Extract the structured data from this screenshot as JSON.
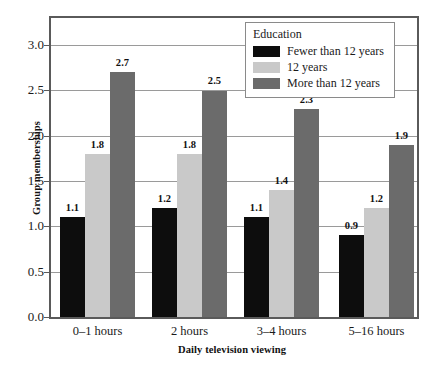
{
  "chart_data": {
    "type": "bar",
    "title": "",
    "subtitle": "",
    "xlabel": "Daily television viewing",
    "ylabel": "Group memberships",
    "categories": [
      "0–1 hours",
      "2 hours",
      "3–4 hours",
      "5–16 hours"
    ],
    "series": [
      {
        "name": "Fewer than 12 years",
        "color": "#0d0d0d",
        "values": [
          1.1,
          1.2,
          1.1,
          0.9
        ],
        "labels": [
          "1.1",
          "1.2",
          "1.1",
          "0.9"
        ]
      },
      {
        "name": "12 years",
        "color": "#c9c9c9",
        "values": [
          1.8,
          1.8,
          1.4,
          1.2
        ],
        "labels": [
          "1.8",
          "1.8",
          "1.4",
          "1.2"
        ]
      },
      {
        "name": "More than 12 years",
        "color": "#6b6b6b",
        "values": [
          2.7,
          2.5,
          2.3,
          1.9
        ],
        "labels": [
          "2.7",
          "2.5",
          "2.3",
          "1.9"
        ]
      }
    ],
    "ylim": [
      0.0,
      3.3
    ],
    "yticks": [
      0.0,
      0.5,
      1.0,
      1.5,
      2.0,
      2.5,
      3.0
    ],
    "ytick_labels": [
      "0.0",
      "0.5",
      "1.0",
      "1.5",
      "2.0",
      "2.5",
      "3.0"
    ],
    "grid": "horizontal",
    "legend": {
      "title": "Education",
      "position": "top-right",
      "entries": [
        {
          "label": "Fewer than 12 years",
          "color": "#0d0d0d"
        },
        {
          "label": "12 years",
          "color": "#c9c9c9"
        },
        {
          "label": "More than 12 years",
          "color": "#6b6b6b"
        }
      ]
    },
    "frame_color": "#5a5a5a",
    "gridline_color": "#9a9a9a",
    "background": "#ffffff"
  }
}
